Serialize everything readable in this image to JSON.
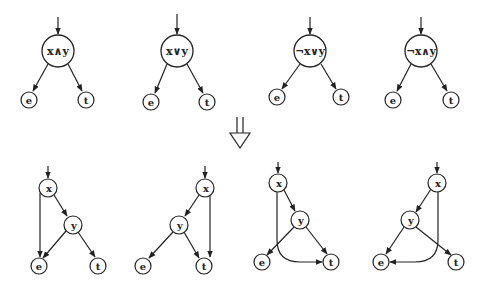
{
  "colors": {
    "stroke": "#222222",
    "background": "#ffffff"
  },
  "top_row": [
    {
      "id": "g1",
      "root": {
        "label": "x∧y",
        "x": 58,
        "y": 51
      },
      "e": {
        "label": "e",
        "x": 29,
        "y": 100
      },
      "t": {
        "label": "t",
        "x": 86,
        "y": 100
      }
    },
    {
      "id": "g2",
      "root": {
        "label": "x∨y",
        "x": 177,
        "y": 51
      },
      "e": {
        "label": "e",
        "x": 151,
        "y": 102
      },
      "t": {
        "label": "t",
        "x": 207,
        "y": 102
      }
    },
    {
      "id": "g3",
      "root": {
        "label": "¬x∨y",
        "x": 310,
        "y": 51
      },
      "e": {
        "label": "e",
        "x": 277,
        "y": 97
      },
      "t": {
        "label": "t",
        "x": 341,
        "y": 97
      }
    },
    {
      "id": "g4",
      "root": {
        "label": "¬x∧y",
        "x": 421,
        "y": 51
      },
      "e": {
        "label": "e",
        "x": 393,
        "y": 100
      },
      "t": {
        "label": "t",
        "x": 451,
        "y": 100
      }
    }
  ],
  "transform_arrow": {
    "symbol": "⇓",
    "x": 240,
    "y": 120
  },
  "bottom_row": [
    {
      "id": "b1",
      "x": {
        "label": "x",
        "x": 48,
        "y": 188
      },
      "y": {
        "label": "y",
        "x": 73,
        "y": 225
      },
      "e": {
        "label": "e",
        "x": 39,
        "y": 266
      },
      "t": {
        "label": "t",
        "x": 98,
        "y": 266
      }
    },
    {
      "id": "b2",
      "x": {
        "label": "x",
        "x": 205,
        "y": 188
      },
      "y": {
        "label": "y",
        "x": 179,
        "y": 225
      },
      "e": {
        "label": "e",
        "x": 143,
        "y": 266
      },
      "t": {
        "label": "t",
        "x": 204,
        "y": 266
      }
    },
    {
      "id": "b3",
      "x": {
        "label": "x",
        "x": 278,
        "y": 183
      },
      "y": {
        "label": "y",
        "x": 300,
        "y": 220
      },
      "e": {
        "label": "e",
        "x": 262,
        "y": 262
      },
      "t": {
        "label": "t",
        "x": 331,
        "y": 262
      }
    },
    {
      "id": "b4",
      "x": {
        "label": "x",
        "x": 437,
        "y": 183
      },
      "y": {
        "label": "y",
        "x": 410,
        "y": 220
      },
      "e": {
        "label": "e",
        "x": 381,
        "y": 262
      },
      "t": {
        "label": "t",
        "x": 456,
        "y": 262
      }
    }
  ]
}
